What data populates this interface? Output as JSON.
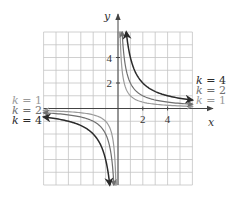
{
  "chart_data": {
    "type": "line",
    "title": "",
    "xlabel": "x",
    "ylabel": "y",
    "xlim": [
      -6,
      6
    ],
    "ylim": [
      -6,
      6
    ],
    "grid": true,
    "x_ticks": [
      {
        "value": 2,
        "label": "2"
      },
      {
        "value": 4,
        "label": "4"
      }
    ],
    "y_ticks": [
      {
        "value": 2,
        "label": "2"
      },
      {
        "value": 4,
        "label": "4"
      }
    ],
    "function": "y = k/x",
    "series": [
      {
        "name": "k = 1",
        "k": 1,
        "color": "#9a9a9a"
      },
      {
        "name": "k = 2",
        "k": 2,
        "color": "#6f6f6f"
      },
      {
        "name": "k = 4",
        "k": 4,
        "color": "#2a2a2a"
      }
    ],
    "legend_right": [
      "k = 4",
      "k = 2",
      "k = 1"
    ],
    "legend_left": [
      "k = 1",
      "k = 2",
      "k = 4"
    ]
  }
}
